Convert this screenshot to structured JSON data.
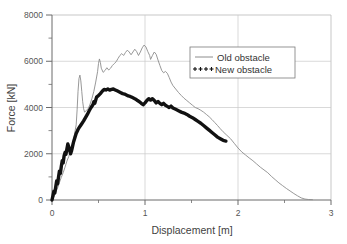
{
  "chart_data": {
    "type": "line",
    "title": "",
    "xlabel": "Displacement [m]",
    "ylabel": "Force [kN]",
    "xlim": [
      0,
      3
    ],
    "ylim": [
      0,
      8000
    ],
    "x_ticks": [
      "0",
      "1",
      "2",
      "3"
    ],
    "x_tick_values": [
      0,
      1,
      2,
      3
    ],
    "x_minor_tick_values": [
      0.5,
      1.5,
      2.5
    ],
    "y_ticks": [
      "0",
      "2000",
      "4000",
      "6000",
      "8000"
    ],
    "y_tick_values": [
      0,
      2000,
      4000,
      6000,
      8000
    ],
    "y_minor_tick_values": [
      1000,
      3000,
      5000,
      7000
    ],
    "grid": "major gridlines on both axes, light gray",
    "legend_position": "upper right inside plot area",
    "series": [
      {
        "name": "Old obstacle",
        "style": "thin solid gray line",
        "color": "#8c8c8c",
        "points": [
          [
            0.0,
            0
          ],
          [
            0.02,
            140
          ],
          [
            0.04,
            330
          ],
          [
            0.06,
            520
          ],
          [
            0.08,
            760
          ],
          [
            0.1,
            980
          ],
          [
            0.12,
            1180
          ],
          [
            0.14,
            1420
          ],
          [
            0.16,
            1680
          ],
          [
            0.18,
            1880
          ],
          [
            0.2,
            2180
          ],
          [
            0.22,
            2450
          ],
          [
            0.24,
            2800
          ],
          [
            0.26,
            3250
          ],
          [
            0.27,
            3900
          ],
          [
            0.28,
            4700
          ],
          [
            0.29,
            5250
          ],
          [
            0.3,
            5400
          ],
          [
            0.31,
            5150
          ],
          [
            0.32,
            4700
          ],
          [
            0.33,
            4250
          ],
          [
            0.34,
            3950
          ],
          [
            0.35,
            3800
          ],
          [
            0.37,
            3870
          ],
          [
            0.39,
            3960
          ],
          [
            0.41,
            4150
          ],
          [
            0.43,
            4400
          ],
          [
            0.45,
            4700
          ],
          [
            0.47,
            5100
          ],
          [
            0.49,
            5550
          ],
          [
            0.5,
            5900
          ],
          [
            0.51,
            6100
          ],
          [
            0.52,
            5950
          ],
          [
            0.53,
            5700
          ],
          [
            0.55,
            5520
          ],
          [
            0.57,
            5600
          ],
          [
            0.59,
            5720
          ],
          [
            0.61,
            5620
          ],
          [
            0.63,
            5700
          ],
          [
            0.65,
            5820
          ],
          [
            0.67,
            5900
          ],
          [
            0.69,
            5980
          ],
          [
            0.71,
            6120
          ],
          [
            0.73,
            6250
          ],
          [
            0.75,
            6330
          ],
          [
            0.77,
            6250
          ],
          [
            0.79,
            6380
          ],
          [
            0.81,
            6480
          ],
          [
            0.83,
            6400
          ],
          [
            0.85,
            6280
          ],
          [
            0.87,
            6400
          ],
          [
            0.89,
            6520
          ],
          [
            0.91,
            6420
          ],
          [
            0.93,
            6250
          ],
          [
            0.95,
            6400
          ],
          [
            0.97,
            6580
          ],
          [
            0.99,
            6700
          ],
          [
            1.01,
            6620
          ],
          [
            1.03,
            6420
          ],
          [
            1.05,
            6250
          ],
          [
            1.06,
            6080
          ],
          [
            1.08,
            6250
          ],
          [
            1.1,
            6400
          ],
          [
            1.12,
            6300
          ],
          [
            1.14,
            6050
          ],
          [
            1.16,
            5820
          ],
          [
            1.18,
            5600
          ],
          [
            1.2,
            5500
          ],
          [
            1.22,
            5560
          ],
          [
            1.24,
            5480
          ],
          [
            1.26,
            5300
          ],
          [
            1.28,
            5100
          ],
          [
            1.3,
            4950
          ],
          [
            1.33,
            4800
          ],
          [
            1.36,
            4650
          ],
          [
            1.39,
            4520
          ],
          [
            1.42,
            4400
          ],
          [
            1.45,
            4300
          ],
          [
            1.48,
            4200
          ],
          [
            1.51,
            4100
          ],
          [
            1.54,
            4000
          ],
          [
            1.57,
            3950
          ],
          [
            1.6,
            3880
          ],
          [
            1.63,
            3800
          ],
          [
            1.66,
            3700
          ],
          [
            1.69,
            3600
          ],
          [
            1.72,
            3480
          ],
          [
            1.75,
            3350
          ],
          [
            1.78,
            3220
          ],
          [
            1.81,
            3080
          ],
          [
            1.84,
            2950
          ],
          [
            1.88,
            2800
          ],
          [
            1.92,
            2650
          ],
          [
            1.96,
            2450
          ],
          [
            2.0,
            2250
          ],
          [
            2.04,
            2080
          ],
          [
            2.08,
            1950
          ],
          [
            2.12,
            1820
          ],
          [
            2.16,
            1700
          ],
          [
            2.2,
            1560
          ],
          [
            2.24,
            1420
          ],
          [
            2.28,
            1300
          ],
          [
            2.32,
            1180
          ],
          [
            2.36,
            1020
          ],
          [
            2.4,
            880
          ],
          [
            2.44,
            740
          ],
          [
            2.48,
            620
          ],
          [
            2.52,
            500
          ],
          [
            2.56,
            390
          ],
          [
            2.6,
            280
          ],
          [
            2.64,
            180
          ],
          [
            2.68,
            90
          ],
          [
            2.72,
            40
          ],
          [
            2.76,
            20
          ],
          [
            2.8,
            15
          ]
        ]
      },
      {
        "name": "New obstacle",
        "style": "thick jagged black line",
        "color": "#111111",
        "points": [
          [
            0.0,
            0
          ],
          [
            0.01,
            180
          ],
          [
            0.02,
            380
          ],
          [
            0.03,
            300
          ],
          [
            0.04,
            560
          ],
          [
            0.05,
            820
          ],
          [
            0.06,
            700
          ],
          [
            0.07,
            980
          ],
          [
            0.08,
            1250
          ],
          [
            0.09,
            1150
          ],
          [
            0.1,
            1450
          ],
          [
            0.11,
            1700
          ],
          [
            0.12,
            1600
          ],
          [
            0.13,
            1900
          ],
          [
            0.14,
            2050
          ],
          [
            0.15,
            1980
          ],
          [
            0.16,
            2200
          ],
          [
            0.17,
            2420
          ],
          [
            0.18,
            2300
          ],
          [
            0.19,
            2150
          ],
          [
            0.2,
            2000
          ],
          [
            0.21,
            2120
          ],
          [
            0.22,
            2300
          ],
          [
            0.23,
            2480
          ],
          [
            0.24,
            2620
          ],
          [
            0.25,
            2750
          ],
          [
            0.26,
            2880
          ],
          [
            0.27,
            2960
          ],
          [
            0.28,
            3050
          ],
          [
            0.3,
            3180
          ],
          [
            0.32,
            3300
          ],
          [
            0.34,
            3420
          ],
          [
            0.36,
            3560
          ],
          [
            0.38,
            3700
          ],
          [
            0.4,
            3860
          ],
          [
            0.42,
            4000
          ],
          [
            0.44,
            4120
          ],
          [
            0.45,
            4250
          ],
          [
            0.46,
            4180
          ],
          [
            0.47,
            4320
          ],
          [
            0.48,
            4450
          ],
          [
            0.5,
            4520
          ],
          [
            0.52,
            4600
          ],
          [
            0.54,
            4700
          ],
          [
            0.56,
            4780
          ],
          [
            0.58,
            4760
          ],
          [
            0.6,
            4800
          ],
          [
            0.62,
            4750
          ],
          [
            0.64,
            4780
          ],
          [
            0.66,
            4800
          ],
          [
            0.68,
            4760
          ],
          [
            0.7,
            4720
          ],
          [
            0.72,
            4680
          ],
          [
            0.74,
            4640
          ],
          [
            0.76,
            4600
          ],
          [
            0.78,
            4580
          ],
          [
            0.8,
            4540
          ],
          [
            0.82,
            4500
          ],
          [
            0.84,
            4480
          ],
          [
            0.86,
            4440
          ],
          [
            0.88,
            4400
          ],
          [
            0.9,
            4360
          ],
          [
            0.92,
            4300
          ],
          [
            0.94,
            4250
          ],
          [
            0.96,
            4180
          ],
          [
            0.98,
            4120
          ],
          [
            1.0,
            4200
          ],
          [
            1.02,
            4300
          ],
          [
            1.04,
            4380
          ],
          [
            1.06,
            4320
          ],
          [
            1.08,
            4380
          ],
          [
            1.1,
            4300
          ],
          [
            1.12,
            4200
          ],
          [
            1.14,
            4260
          ],
          [
            1.16,
            4180
          ],
          [
            1.18,
            4120
          ],
          [
            1.2,
            4180
          ],
          [
            1.22,
            4100
          ],
          [
            1.24,
            4050
          ],
          [
            1.26,
            4000
          ],
          [
            1.28,
            4060
          ],
          [
            1.3,
            3980
          ],
          [
            1.33,
            3920
          ],
          [
            1.36,
            3860
          ],
          [
            1.39,
            3800
          ],
          [
            1.42,
            3760
          ],
          [
            1.45,
            3700
          ],
          [
            1.48,
            3620
          ],
          [
            1.51,
            3560
          ],
          [
            1.54,
            3480
          ],
          [
            1.57,
            3400
          ],
          [
            1.6,
            3320
          ],
          [
            1.63,
            3220
          ],
          [
            1.66,
            3120
          ],
          [
            1.69,
            3020
          ],
          [
            1.72,
            2920
          ],
          [
            1.75,
            2820
          ],
          [
            1.78,
            2720
          ],
          [
            1.81,
            2650
          ],
          [
            1.84,
            2580
          ],
          [
            1.87,
            2550
          ]
        ]
      }
    ]
  },
  "legend": {
    "items": [
      {
        "label": "Old obstacle",
        "marker": "line"
      },
      {
        "label": "New obstacle",
        "marker": "plus-markers"
      }
    ]
  },
  "colors": {
    "old_obstacle": "#8c8c8c",
    "new_obstacle": "#111111",
    "grid": "#c8c8c8",
    "axis": "#6b6b6b",
    "background": "#ffffff"
  }
}
